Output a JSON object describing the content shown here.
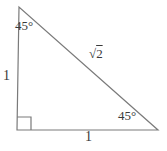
{
  "figure": {
    "kind": "right-isosceles-triangle-diagram",
    "labels": {
      "top_angle": "45°",
      "bottom_right_angle": "45°",
      "hypotenuse_radical": "√",
      "hypotenuse_radicand": "2",
      "left_side": "1",
      "bottom_side": "1"
    },
    "colors": {
      "line": "#7a7a7a",
      "text": "#3a3a3a",
      "background": "#ffffff"
    }
  }
}
